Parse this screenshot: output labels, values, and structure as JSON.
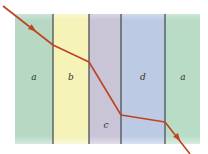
{
  "diagram": {
    "layers": [
      {
        "label": "a",
        "color": "#b7d9c4"
      },
      {
        "label": "b",
        "color": "#f5f3b8"
      },
      {
        "label": "c",
        "color": "#c9c4d6"
      },
      {
        "label": "d",
        "color": "#bccbe3"
      },
      {
        "label": "a",
        "color": "#b9dcc6"
      }
    ],
    "boundary_color": "#4a5058",
    "ray_color": "#c0421f",
    "arrow_count": 2
  }
}
